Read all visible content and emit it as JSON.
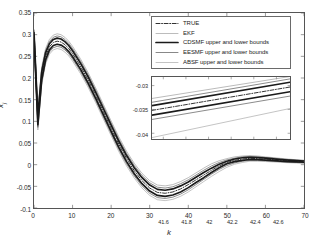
{
  "chart_data": {
    "type": "line",
    "title": "",
    "xlabel": "k",
    "ylabel": "x_j",
    "xlim": [
      0,
      70
    ],
    "ylim": [
      -0.1,
      0.35
    ],
    "xticks": [
      "0",
      "10",
      "20",
      "30",
      "40",
      "50",
      "60",
      "70"
    ],
    "yticks": [
      "0.35",
      "0.3",
      "0.25",
      "0.2",
      "0.15",
      "0.1",
      "0.05",
      "0",
      "-0.05",
      "-0.1"
    ],
    "grid": false,
    "legend_position": "top-right",
    "legend": [
      {
        "label": "TRUE",
        "style": "dash-dot",
        "color": "#1a1a1a"
      },
      {
        "label": "EKF",
        "style": "solid-thin",
        "color": "#8f8f8f"
      },
      {
        "label": "CDSMF upper and lower bounds",
        "style": "solid-thick",
        "color": "#1a1a1a"
      },
      {
        "label": "EESMF upper and lower bounds",
        "style": "solid",
        "color": "#555555"
      },
      {
        "label": "ABSF upper and lower bounds",
        "style": "solid-light",
        "color": "#9a9a9a"
      }
    ],
    "x": [
      0,
      1,
      2,
      3,
      4,
      5,
      6,
      7,
      8,
      9,
      10,
      12,
      14,
      16,
      18,
      20,
      22,
      24,
      26,
      28,
      30,
      32,
      34,
      36,
      38,
      40,
      42,
      44,
      46,
      48,
      50,
      52,
      54,
      56,
      58,
      60,
      62,
      64,
      66,
      68,
      70
    ],
    "series": [
      {
        "name": "TRUE",
        "values": [
          0.3,
          0.102,
          0.205,
          0.25,
          0.272,
          0.282,
          0.285,
          0.283,
          0.277,
          0.268,
          0.256,
          0.228,
          0.196,
          0.16,
          0.122,
          0.084,
          0.047,
          0.014,
          -0.014,
          -0.037,
          -0.054,
          -0.064,
          -0.066,
          -0.063,
          -0.056,
          -0.046,
          -0.035,
          -0.024,
          -0.013,
          -0.003,
          0.005,
          0.01,
          0.013,
          0.0145,
          0.014,
          0.0128,
          0.0115,
          0.01,
          0.0088,
          0.0078,
          0.007
        ]
      },
      {
        "name": "CDSMF upper bound",
        "values": [
          0.305,
          0.112,
          0.214,
          0.258,
          0.279,
          0.289,
          0.292,
          0.29,
          0.284,
          0.275,
          0.263,
          0.235,
          0.203,
          0.167,
          0.129,
          0.091,
          0.054,
          0.021,
          -0.007,
          -0.03,
          -0.047,
          -0.057,
          -0.059,
          -0.056,
          -0.049,
          -0.04,
          -0.029,
          -0.018,
          -0.008,
          0.001,
          0.008,
          0.013,
          0.016,
          0.017,
          0.0165,
          0.015,
          0.0135,
          0.012,
          0.0105,
          0.0093,
          0.0085
        ]
      },
      {
        "name": "CDSMF lower bound",
        "values": [
          0.295,
          0.092,
          0.196,
          0.242,
          0.265,
          0.275,
          0.278,
          0.276,
          0.27,
          0.261,
          0.249,
          0.221,
          0.189,
          0.153,
          0.115,
          0.077,
          0.04,
          0.007,
          -0.021,
          -0.044,
          -0.061,
          -0.071,
          -0.073,
          -0.07,
          -0.063,
          -0.053,
          -0.041,
          -0.03,
          -0.018,
          -0.007,
          0.002,
          0.007,
          0.01,
          0.012,
          0.0115,
          0.0106,
          0.0095,
          0.0082,
          0.0071,
          0.0063,
          0.0055
        ]
      },
      {
        "name": "EESMF upper bound",
        "values": [
          0.31,
          0.118,
          0.22,
          0.263,
          0.284,
          0.294,
          0.297,
          0.295,
          0.289,
          0.28,
          0.268,
          0.24,
          0.208,
          0.172,
          0.134,
          0.096,
          0.059,
          0.026,
          -0.002,
          -0.025,
          -0.042,
          -0.052,
          -0.054,
          -0.051,
          -0.044,
          -0.035,
          -0.024,
          -0.013,
          -0.003,
          0.005,
          0.011,
          0.015,
          0.018,
          0.019,
          0.018,
          0.0165,
          0.015,
          0.0133,
          0.0118,
          0.0105,
          0.0095
        ]
      },
      {
        "name": "EESMF lower bound",
        "values": [
          0.29,
          0.086,
          0.19,
          0.237,
          0.26,
          0.27,
          0.273,
          0.271,
          0.265,
          0.256,
          0.244,
          0.216,
          0.184,
          0.148,
          0.11,
          0.072,
          0.035,
          0.002,
          -0.026,
          -0.049,
          -0.066,
          -0.076,
          -0.078,
          -0.075,
          -0.068,
          -0.058,
          -0.046,
          -0.034,
          -0.022,
          -0.011,
          -0.002,
          0.004,
          0.008,
          0.01,
          0.0098,
          0.009,
          0.008,
          0.0068,
          0.0058,
          0.005,
          0.0043
        ]
      },
      {
        "name": "ABSF upper bound",
        "values": [
          0.312,
          0.124,
          0.226,
          0.268,
          0.289,
          0.299,
          0.302,
          0.3,
          0.294,
          0.285,
          0.273,
          0.245,
          0.213,
          0.177,
          0.139,
          0.101,
          0.064,
          0.031,
          0.003,
          -0.02,
          -0.037,
          -0.047,
          -0.049,
          -0.046,
          -0.039,
          -0.03,
          -0.019,
          -0.008,
          0.002,
          0.009,
          0.014,
          0.018,
          0.02,
          0.021,
          0.02,
          0.018,
          0.0163,
          0.0145,
          0.0128,
          0.0114,
          0.0103
        ]
      },
      {
        "name": "ABSF lower bound",
        "values": [
          0.288,
          0.08,
          0.184,
          0.232,
          0.255,
          0.265,
          0.268,
          0.266,
          0.26,
          0.251,
          0.239,
          0.211,
          0.179,
          0.143,
          0.105,
          0.067,
          0.03,
          -0.003,
          -0.031,
          -0.054,
          -0.071,
          -0.081,
          -0.083,
          -0.08,
          -0.073,
          -0.063,
          -0.051,
          -0.039,
          -0.027,
          -0.016,
          -0.006,
          0.001,
          0.005,
          0.008,
          0.0078,
          0.0072,
          0.0063,
          0.0053,
          0.0045,
          0.0038,
          0.0032
        ]
      }
    ]
  },
  "inset": {
    "type": "line",
    "xlim": [
      41.5,
      42.72
    ],
    "ylim": [
      -0.0412,
      -0.0282
    ],
    "xticks": [
      "41.6",
      "41.8",
      "42",
      "42.2",
      "42.4",
      "42.6"
    ],
    "xtick_values": [
      41.6,
      41.8,
      42.0,
      42.2,
      42.4,
      42.6
    ],
    "yticks": [
      "-0.03",
      "-0.035",
      "-0.04"
    ],
    "ytick_values": [
      -0.03,
      -0.035,
      -0.04
    ],
    "grid": false,
    "series": [
      {
        "name": "TRUE",
        "x": [
          41.5,
          42.72
        ],
        "y": [
          -0.0352,
          -0.0303
        ],
        "style": "dash-dot",
        "color": "#1a1a1a"
      },
      {
        "name": "CDSMF upper bound",
        "x": [
          41.5,
          42.72
        ],
        "y": [
          -0.0342,
          -0.0293
        ],
        "style": "solid-thick",
        "color": "#1a1a1a"
      },
      {
        "name": "CDSMF lower bound",
        "x": [
          41.5,
          42.72
        ],
        "y": [
          -0.0362,
          -0.0313
        ],
        "style": "solid-thick",
        "color": "#1a1a1a"
      },
      {
        "name": "EESMF upper bound",
        "x": [
          41.5,
          42.72
        ],
        "y": [
          -0.0335,
          -0.0286
        ],
        "style": "solid",
        "color": "#555555"
      },
      {
        "name": "EESMF lower bound",
        "x": [
          41.5,
          42.72
        ],
        "y": [
          -0.0371,
          -0.0322
        ],
        "style": "solid",
        "color": "#555555"
      },
      {
        "name": "ABSF upper bound",
        "x": [
          41.5,
          42.72
        ],
        "y": [
          -0.0327,
          -0.0281
        ],
        "style": "solid-light",
        "color": "#8a8a8a"
      },
      {
        "name": "ABSF lower bound",
        "x": [
          41.5,
          42.72
        ],
        "y": [
          -0.0409,
          -0.0348
        ],
        "style": "solid-light",
        "color": "#9a9a9a"
      }
    ]
  }
}
